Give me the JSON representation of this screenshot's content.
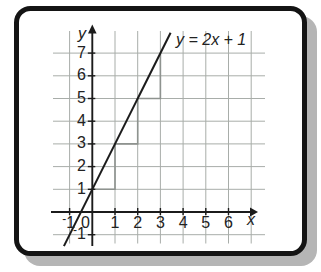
{
  "colors": {
    "background": "#ffffff",
    "card_fill": "#ffffff",
    "card_border": "#141414",
    "card_shadow": "#b5b5b5",
    "grid": "#a8ada9",
    "axis": "#1b1b1b",
    "function_line": "#1b1b1b",
    "slope_steps": "#8e938f",
    "text": "#222222"
  },
  "chart_data": {
    "type": "line",
    "equation_label": "y = 2x + 1",
    "series": [
      {
        "name": "y = 2x + 1",
        "slope": 2,
        "intercept": 1,
        "x": [
          -1,
          0,
          1,
          2,
          3
        ],
        "y": [
          -1,
          1,
          3,
          5,
          7
        ]
      }
    ],
    "line_draw_range": {
      "x_start": -1.25,
      "x_end": 3.45
    },
    "slope_steps": [
      [
        0,
        1
      ],
      [
        1,
        1
      ],
      [
        1,
        3
      ],
      [
        2,
        3
      ],
      [
        2,
        5
      ],
      [
        3,
        5
      ],
      [
        3,
        7
      ]
    ],
    "axis": {
      "xlabel": "x",
      "ylabel": "y",
      "origin_label": "0",
      "xlim": [
        -1.7,
        7.6
      ],
      "ylim": [
        -1.5,
        7.9
      ],
      "xticks": [
        -1,
        1,
        2,
        3,
        4,
        5,
        6
      ],
      "xtick_labels": [
        "⁻1",
        "1",
        "2",
        "3",
        "4",
        "5",
        "6"
      ],
      "yticks": [
        -1,
        1,
        2,
        3,
        4,
        5,
        6,
        7
      ],
      "ytick_labels": [
        "⁻1",
        "1",
        "2",
        "3",
        "4",
        "5",
        "6",
        "7"
      ],
      "grid": true,
      "grid_x": [
        -1,
        1,
        2,
        3,
        4,
        5,
        6,
        7
      ],
      "grid_y": [
        -1,
        1,
        2,
        3,
        4,
        5,
        6,
        7
      ]
    }
  }
}
